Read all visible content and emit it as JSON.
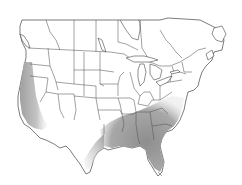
{
  "map": {
    "type": "range-map",
    "region": "North America (United States and southern Canada)",
    "background_color": "#ffffff",
    "border_color": "#555555",
    "range_color": "#9a9a9a",
    "range_edge_color": "#d8d8d8",
    "range_regions": [
      {
        "name": "Pacific Coast",
        "label": "Pacific coast range"
      },
      {
        "name": "Southeast",
        "label": "Southeastern range"
      },
      {
        "name": "Gulf Coast Texas",
        "label": "Texas Gulf coast range"
      }
    ]
  }
}
